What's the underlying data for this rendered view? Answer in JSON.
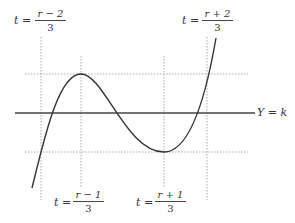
{
  "diagram": {
    "type": "cubic-curve-sketch",
    "colors": {
      "curve": "#333333",
      "line": "#444444",
      "dotted": "#aaaaaa",
      "text": "#333333"
    },
    "horizontal_line": {
      "label": "Y = k",
      "y": 113,
      "x1": 15,
      "x2": 255
    },
    "dotted_horizontals": [
      {
        "name": "max-level",
        "y": 74,
        "x1": 25,
        "x2": 248
      },
      {
        "name": "min-level",
        "y": 152,
        "x1": 25,
        "x2": 248
      }
    ],
    "dotted_verticals": [
      {
        "name": "t-r-minus-2",
        "x": 41,
        "y1": 37,
        "y2": 200
      },
      {
        "name": "t-r-minus-1",
        "x": 81,
        "y1": 56,
        "y2": 188
      },
      {
        "name": "t-r-plus-1",
        "x": 164,
        "y1": 56,
        "y2": 188
      },
      {
        "name": "t-r-plus-2",
        "x": 207,
        "y1": 37,
        "y2": 200
      }
    ],
    "curve": {
      "start": [
        32,
        188
      ],
      "max": [
        81,
        74
      ],
      "min": [
        164,
        152
      ],
      "end": [
        216,
        38
      ]
    },
    "labels": [
      {
        "name": "label-t-r-minus-2",
        "lhs": "t",
        "eq": "=",
        "numerator": "r − 2",
        "denominator": "3",
        "position": "top-left"
      },
      {
        "name": "label-t-r-plus-2",
        "lhs": "t",
        "eq": "=",
        "numerator": "r + 2",
        "denominator": "3",
        "position": "top-right"
      },
      {
        "name": "label-t-r-minus-1",
        "lhs": "t",
        "eq": "=",
        "numerator": "r − 1",
        "denominator": "3",
        "position": "bottom-left"
      },
      {
        "name": "label-t-r-plus-1",
        "lhs": "t",
        "eq": "=",
        "numerator": "r + 1",
        "denominator": "3",
        "position": "bottom-right"
      }
    ],
    "line_label": {
      "y_var": "Y",
      "eq": "=",
      "k_var": "k"
    }
  }
}
